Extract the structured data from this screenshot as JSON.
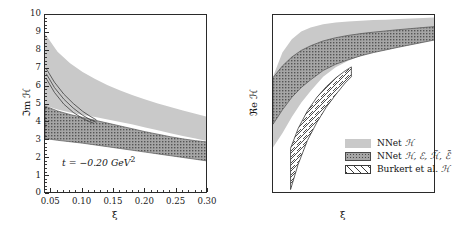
{
  "figure": {
    "panels": [
      "left",
      "right"
    ]
  },
  "left": {
    "ylabel": "ℑm ℋ",
    "xlabel": "ξ",
    "annotation": "t = −0.20 GeV",
    "annotation_exp": "2",
    "yticks": [
      "0",
      "1",
      "2",
      "3",
      "4",
      "5",
      "6",
      "7",
      "8",
      "9",
      "10"
    ],
    "xticks": [
      "0.05",
      "0.10",
      "0.15",
      "0.20",
      "0.25",
      "0.30"
    ]
  },
  "right": {
    "ylabel": "ℜe ℋ",
    "xlabel": "ξ",
    "yticks": [
      "−10",
      "−9",
      "−8",
      "−7",
      "−6",
      "−5",
      "−4",
      "−3",
      "−2",
      "−1",
      "0"
    ],
    "xticks": [
      "0.05",
      "0.10",
      "0.15",
      "0.20",
      "0.25",
      "0.30"
    ]
  },
  "legend": {
    "items": [
      {
        "label_pre": "NNet ",
        "label_sym": "ℋ",
        "style": "solid-gray",
        "name": "nnet-h"
      },
      {
        "label_pre": "NNet ",
        "label_sym": "ℋ, ℰ, ℋ̃, ℰ̃",
        "style": "stipple",
        "name": "nnet-h-e-ht-et"
      },
      {
        "label_pre": "Burkert et al. ",
        "label_sym": "ℋ",
        "style": "hatch",
        "name": "burkert-h"
      }
    ]
  },
  "colors": {
    "band_light_gray": "#c9c9c9",
    "band_stipple_fill": "#8f8f8f",
    "band_stipple_line": "#5a5a5a",
    "hatch_line": "#3a3a3a",
    "axis": "#2a2a2a",
    "text": "#141414"
  },
  "chart_data": [
    {
      "type": "area",
      "panel": "left",
      "title": "",
      "xlabel": "ξ",
      "ylabel": "ℑm ℋ",
      "xlim": [
        0.04,
        0.3
      ],
      "ylim": [
        0,
        10
      ],
      "xticks": [
        0.05,
        0.1,
        0.15,
        0.2,
        0.25,
        0.3
      ],
      "yticks": [
        0,
        1,
        2,
        3,
        4,
        5,
        6,
        7,
        8,
        9,
        10
      ],
      "grid": false,
      "legend": "none",
      "annotations": [
        "t = −0.20 GeV^2"
      ],
      "series": [
        {
          "name": "NNet ℋ",
          "style": "solid-gray",
          "x": [
            0.04,
            0.06,
            0.08,
            0.1,
            0.12,
            0.14,
            0.16,
            0.18,
            0.2,
            0.22,
            0.24,
            0.26,
            0.28,
            0.3
          ],
          "upper": [
            8.95,
            7.95,
            7.3,
            6.82,
            6.42,
            6.08,
            5.78,
            5.52,
            5.28,
            5.06,
            4.86,
            4.66,
            4.48,
            4.3
          ],
          "lower": [
            4.95,
            4.72,
            4.56,
            4.42,
            4.3,
            4.16,
            4.02,
            3.88,
            3.72,
            3.56,
            3.4,
            3.24,
            3.1,
            2.95
          ]
        },
        {
          "name": "NNet ℋ, ℰ, ℋ̃, ℰ̃",
          "style": "stipple",
          "x": [
            0.04,
            0.06,
            0.08,
            0.1,
            0.12,
            0.14,
            0.16,
            0.18,
            0.2,
            0.22,
            0.24,
            0.26,
            0.28,
            0.3
          ],
          "upper": [
            4.92,
            4.64,
            4.44,
            4.28,
            4.12,
            3.96,
            3.8,
            3.64,
            3.48,
            3.34,
            3.2,
            3.08,
            2.98,
            2.9
          ],
          "lower": [
            3.1,
            3.0,
            2.92,
            2.84,
            2.74,
            2.64,
            2.54,
            2.44,
            2.34,
            2.24,
            2.14,
            2.04,
            1.94,
            1.84
          ]
        }
      ],
      "lines": [
        {
          "name": "curve-1",
          "x": [
            0.042,
            0.055,
            0.07,
            0.085,
            0.1,
            0.112,
            0.122
          ],
          "y": [
            7.0,
            6.25,
            5.58,
            5.06,
            4.62,
            4.34,
            4.14
          ]
        },
        {
          "name": "curve-2",
          "x": [
            0.042,
            0.055,
            0.07,
            0.085,
            0.1,
            0.112,
            0.122
          ],
          "y": [
            6.72,
            5.95,
            5.3,
            4.8,
            4.4,
            4.16,
            4.0
          ]
        },
        {
          "name": "curve-3",
          "x": [
            0.042,
            0.055,
            0.07,
            0.085,
            0.1,
            0.11,
            0.118
          ],
          "y": [
            6.45,
            5.68,
            5.02,
            4.56,
            4.22,
            4.05,
            3.95
          ]
        }
      ]
    },
    {
      "type": "area",
      "panel": "right",
      "title": "",
      "xlabel": "ξ",
      "ylabel": "ℜe ℋ",
      "xlim": [
        0.04,
        0.3
      ],
      "ylim": [
        -10,
        0
      ],
      "xticks": [
        0.05,
        0.1,
        0.15,
        0.2,
        0.25,
        0.3
      ],
      "yticks": [
        -10,
        -9,
        -8,
        -7,
        -6,
        -5,
        -4,
        -3,
        -2,
        -1,
        0
      ],
      "grid": false,
      "legend": "lower-right",
      "annotations": [],
      "series": [
        {
          "name": "NNet ℋ",
          "style": "solid-gray",
          "x": [
            0.04,
            0.055,
            0.07,
            0.085,
            0.1,
            0.12,
            0.14,
            0.16,
            0.18,
            0.2,
            0.22,
            0.24,
            0.26,
            0.28,
            0.3
          ],
          "upper": [
            -3.45,
            -2.1,
            -1.35,
            -0.92,
            -0.7,
            -0.52,
            -0.42,
            -0.36,
            -0.32,
            -0.28,
            -0.26,
            -0.23,
            -0.2,
            -0.17,
            -0.14
          ],
          "lower": [
            -7.4,
            -6.6,
            -5.7,
            -4.9,
            -4.25,
            -3.45,
            -2.92,
            -2.55,
            -2.28,
            -2.05,
            -1.88,
            -1.72,
            -1.58,
            -1.45,
            -1.32
          ]
        },
        {
          "name": "NNet ℋ, ℰ, ℋ̃, ℰ̃",
          "style": "stipple",
          "x": [
            0.04,
            0.055,
            0.07,
            0.085,
            0.1,
            0.12,
            0.14,
            0.16,
            0.18,
            0.2,
            0.22,
            0.24,
            0.26,
            0.28,
            0.3
          ],
          "upper": [
            -3.5,
            -2.85,
            -2.35,
            -1.98,
            -1.72,
            -1.45,
            -1.27,
            -1.14,
            -1.04,
            -0.96,
            -0.89,
            -0.82,
            -0.76,
            -0.7,
            -0.64
          ],
          "lower": [
            -6.1,
            -5.3,
            -4.6,
            -4.05,
            -3.62,
            -3.1,
            -2.75,
            -2.5,
            -2.28,
            -2.1,
            -1.95,
            -1.8,
            -1.66,
            -1.52,
            -1.38
          ]
        },
        {
          "name": "Burkert et al. ℋ",
          "style": "hatch",
          "x": [
            0.068,
            0.08,
            0.095,
            0.11,
            0.125,
            0.14,
            0.155,
            0.165
          ],
          "upper": [
            -7.45,
            -6.35,
            -5.35,
            -4.6,
            -4.0,
            -3.52,
            -3.12,
            -2.9
          ],
          "lower": [
            -9.75,
            -8.35,
            -7.0,
            -6.0,
            -5.15,
            -4.45,
            -3.8,
            -3.45
          ]
        }
      ]
    }
  ]
}
